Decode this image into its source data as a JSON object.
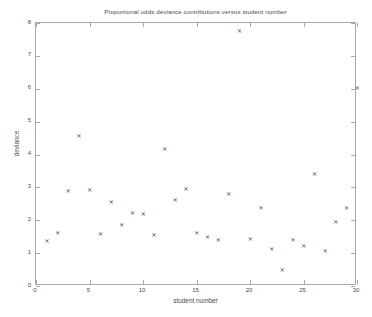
{
  "chart_data": {
    "type": "scatter",
    "title": "Proportional odds deviance contributions versus student number",
    "xlabel": "student number",
    "ylabel": "deviance",
    "xlim": [
      0,
      30
    ],
    "ylim": [
      0,
      8
    ],
    "xticks": [
      0,
      5,
      10,
      15,
      20,
      25,
      30
    ],
    "yticks": [
      0,
      1,
      2,
      3,
      4,
      5,
      6,
      7,
      8
    ],
    "xtick_labels": [
      "0",
      "5",
      "10",
      "15",
      "20",
      "25",
      "30"
    ],
    "ytick_labels": [
      "0",
      "1",
      "2",
      "3",
      "4",
      "5",
      "6",
      "7",
      "8"
    ],
    "grid": false,
    "legend": null,
    "marker": "x",
    "marker_color": "#3a3a3a",
    "x": [
      1,
      2,
      3,
      4,
      5,
      6,
      7,
      8,
      9,
      10,
      11,
      12,
      13,
      14,
      15,
      16,
      17,
      18,
      19,
      20,
      21,
      22,
      23,
      24,
      25,
      26,
      27,
      28,
      29,
      30
    ],
    "y": [
      1.34,
      1.61,
      2.86,
      4.55,
      2.89,
      1.56,
      2.53,
      1.84,
      2.21,
      2.18,
      1.55,
      4.15,
      2.6,
      2.93,
      1.61,
      1.47,
      1.37,
      2.79,
      7.73,
      1.4,
      2.37,
      1.12,
      0.46,
      1.39,
      1.21,
      3.38,
      1.04,
      1.93,
      2.37,
      6.01
    ],
    "points": [
      {
        "student": 1,
        "deviance": 1.34
      },
      {
        "student": 2,
        "deviance": 1.61
      },
      {
        "student": 3,
        "deviance": 2.86
      },
      {
        "student": 4,
        "deviance": 4.55
      },
      {
        "student": 5,
        "deviance": 2.89
      },
      {
        "student": 6,
        "deviance": 1.56
      },
      {
        "student": 7,
        "deviance": 2.53
      },
      {
        "student": 8,
        "deviance": 1.84
      },
      {
        "student": 9,
        "deviance": 2.21
      },
      {
        "student": 10,
        "deviance": 2.18
      },
      {
        "student": 11,
        "deviance": 1.55
      },
      {
        "student": 12,
        "deviance": 4.15
      },
      {
        "student": 13,
        "deviance": 2.6
      },
      {
        "student": 14,
        "deviance": 2.93
      },
      {
        "student": 15,
        "deviance": 1.61
      },
      {
        "student": 16,
        "deviance": 1.47
      },
      {
        "student": 17,
        "deviance": 1.37
      },
      {
        "student": 18,
        "deviance": 2.79
      },
      {
        "student": 19,
        "deviance": 7.73
      },
      {
        "student": 20,
        "deviance": 1.4
      },
      {
        "student": 21,
        "deviance": 2.37
      },
      {
        "student": 22,
        "deviance": 1.12
      },
      {
        "student": 23,
        "deviance": 0.46
      },
      {
        "student": 24,
        "deviance": 1.39
      },
      {
        "student": 25,
        "deviance": 1.21
      },
      {
        "student": 26,
        "deviance": 3.38
      },
      {
        "student": 27,
        "deviance": 1.04
      },
      {
        "student": 28,
        "deviance": 1.93
      },
      {
        "student": 29,
        "deviance": 2.37
      },
      {
        "student": 30,
        "deviance": 6.01
      }
    ]
  }
}
